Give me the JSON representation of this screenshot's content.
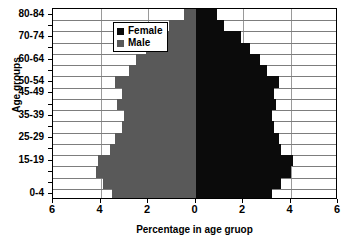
{
  "chart_data": {
    "type": "bar",
    "subtype": "population-pyramid",
    "title": "",
    "xlabel": "Percentage in age gruop",
    "ylabel": "Age groups",
    "xlim": [
      -6,
      6
    ],
    "xticks": [
      -6,
      -4,
      -2,
      0,
      2,
      4,
      6
    ],
    "xticklabels": [
      "6",
      "4",
      "2",
      "0",
      "2",
      "4",
      "6"
    ],
    "grid": true,
    "legend_position": "top-left",
    "categories": [
      "0-4",
      "5-9",
      "10-14",
      "15-19",
      "20-24",
      "25-29",
      "30-34",
      "35-39",
      "40-44",
      "45-49",
      "50-54",
      "55-59",
      "60-64",
      "65-69",
      "70-74",
      "75-79",
      "80-84"
    ],
    "visible_yticklabels": [
      "80-84",
      "70-74",
      "60-64",
      "50-54",
      "45-49",
      "35-39",
      "25-29",
      "15-19",
      "0-4"
    ],
    "series": [
      {
        "name": "Male",
        "color": "#595959",
        "side": "left",
        "values": [
          3.5,
          3.9,
          4.2,
          4.1,
          3.6,
          3.4,
          3.1,
          3.0,
          3.3,
          3.1,
          3.4,
          2.8,
          2.5,
          2.1,
          1.7,
          1.1,
          0.5
        ]
      },
      {
        "name": "Female",
        "color": "#0b0b0b",
        "side": "right",
        "values": [
          3.2,
          3.6,
          4.0,
          4.1,
          3.6,
          3.5,
          3.3,
          3.2,
          3.4,
          3.3,
          3.5,
          3.0,
          2.7,
          2.3,
          1.9,
          1.2,
          0.9
        ]
      }
    ]
  },
  "legend": {
    "items": [
      {
        "label": "Female",
        "color": "#0b0b0b"
      },
      {
        "label": "Male",
        "color": "#595959"
      }
    ]
  }
}
